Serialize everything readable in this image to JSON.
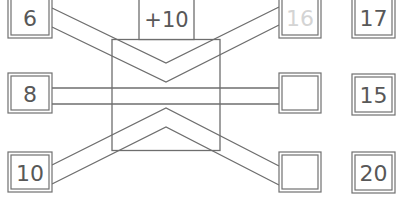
{
  "diagram": {
    "operation": {
      "label": "+10"
    },
    "inputs": [
      {
        "value": "6"
      },
      {
        "value": "8"
      },
      {
        "value": "10"
      }
    ],
    "outputs": [
      {
        "value": "16",
        "faded": true
      },
      {
        "value": ""
      },
      {
        "value": ""
      }
    ],
    "choices": [
      {
        "value": "17"
      },
      {
        "value": "15"
      },
      {
        "value": "20"
      }
    ]
  }
}
